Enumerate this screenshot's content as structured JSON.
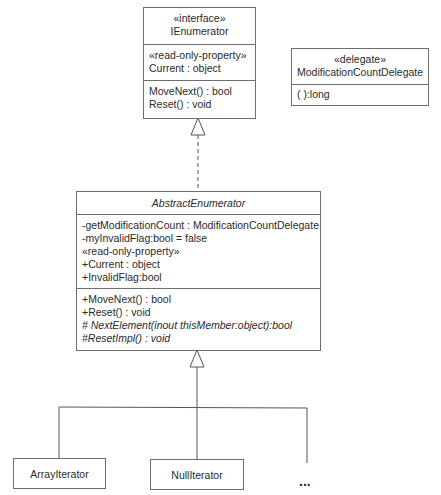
{
  "diagram": {
    "type": "UML class diagram",
    "ienumerator": {
      "stereotype": "«interface»",
      "name": "IEnumerator",
      "attributes": [
        "«read-only-property»",
        "Current : object"
      ],
      "operations": [
        "MoveNext() : bool",
        "Reset() : void"
      ]
    },
    "delegate": {
      "stereotype": "«delegate»",
      "name": "ModificationCountDelegate",
      "operations": [
        "( ):long"
      ]
    },
    "abstract_enumerator": {
      "name": "AbstractEnumerator",
      "attributes": [
        "-getModificationCount : ModificationCountDelegate",
        "-myInvalidFlag:bool = false",
        "«read-only-property»",
        "+Current : object",
        "+InvalidFlag:bool"
      ],
      "operations": [
        "+MoveNext() : bool",
        "+Reset() : void",
        "# NextElement(inout thisMember:object):bool",
        "#ResetImpl() : void"
      ]
    },
    "subclasses": [
      "ArrayIterator",
      "NullIterator"
    ],
    "more_indicator": "..."
  }
}
